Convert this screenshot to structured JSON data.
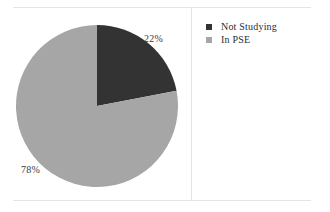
{
  "figure": {
    "background_color": "#ffffff",
    "rule_color": "#e4e4e4",
    "divider_color": "#e4e4e4"
  },
  "chart_data": {
    "type": "pie",
    "title": "",
    "subtitle": "",
    "xlabel": "",
    "ylabel": "",
    "grid": false,
    "legend_position": "right",
    "start_angle_deg": 0,
    "direction": "clockwise",
    "categories": [
      "Not Studying",
      "In PSE"
    ],
    "values": [
      22,
      78
    ],
    "value_unit": "%",
    "data_labels": [
      "22%",
      "78%"
    ],
    "colors": [
      "#333333",
      "#a6a6a6"
    ],
    "slices": [
      {
        "label": "Not Studying",
        "value": 22,
        "data_label": "22%",
        "color": "#333333",
        "start_angle_deg": 0,
        "end_angle_deg": 79.2
      },
      {
        "label": "In PSE",
        "value": 78,
        "data_label": "78%",
        "color": "#a6a6a6",
        "start_angle_deg": 79.2,
        "end_angle_deg": 360
      }
    ]
  },
  "legend": {
    "items": [
      {
        "label": "Not Studying",
        "color": "#333333"
      },
      {
        "label": "In PSE",
        "color": "#a6a6a6"
      }
    ]
  }
}
